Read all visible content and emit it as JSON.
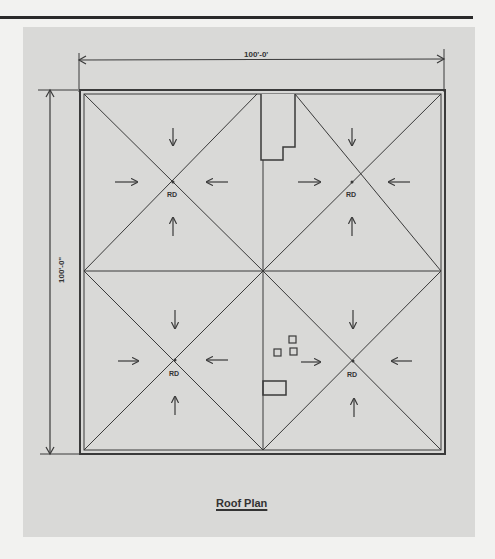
{
  "drawing": {
    "title": "Roof Plan",
    "width_dimension": "100'-0'",
    "height_dimension": "100'-0\"",
    "roof_drain_label": "RD",
    "roof_drains": [
      {
        "id": "rd-nw",
        "label": "RD"
      },
      {
        "id": "rd-ne",
        "label": "RD"
      },
      {
        "id": "rd-sw",
        "label": "RD"
      },
      {
        "id": "rd-se",
        "label": "RD"
      }
    ],
    "colors": {
      "background": "#f2f2f0",
      "panel": "#d9d9d7",
      "lines": "#3a3a3a"
    }
  }
}
